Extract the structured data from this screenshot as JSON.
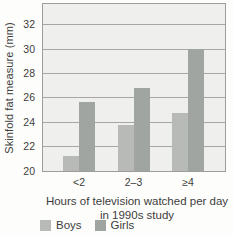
{
  "chart_data": {
    "type": "bar",
    "title": "",
    "categories": [
      "<2",
      "2–3",
      "≥4"
    ],
    "series": [
      {
        "name": "Boys",
        "color": "#b7bab6",
        "values": [
          21.2,
          23.8,
          24.8
        ]
      },
      {
        "name": "Girls",
        "color": "#a0a5a2",
        "values": [
          25.7,
          26.8,
          30.0
        ]
      }
    ],
    "ylabel": "Skinfold fat measure (mm)",
    "xlabel_line1": "Hours of television watched per day",
    "xlabel_line2": "in 1990s study",
    "ylim": [
      20,
      33.7
    ],
    "yticks": [
      20,
      22,
      24,
      26,
      28,
      30,
      32
    ],
    "grid": true,
    "legend_position": "bottom-left",
    "colors": {
      "page_background": "#fdfdfc",
      "plot_background": "#efefed",
      "gridline": "#a6a6a4",
      "plot_border": "#9d9d9b",
      "text": "#3d3d3b"
    }
  }
}
